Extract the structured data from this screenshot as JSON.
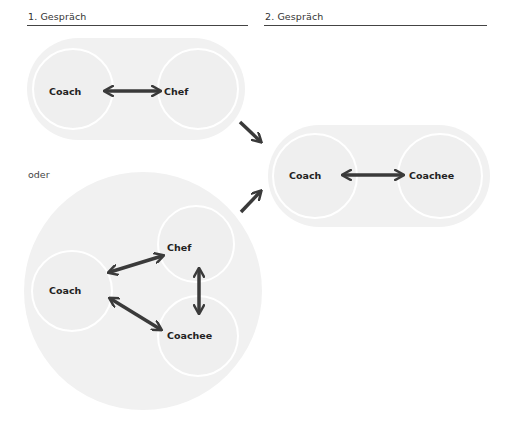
{
  "headers": {
    "first": "1. Gespräch",
    "second": "2. Gespräch"
  },
  "separator_label": "oder",
  "colors": {
    "group_fill": "#f1f1f1",
    "circle_outline": "#ffffff",
    "arrow": "#3a3a3a",
    "text": "#222222",
    "header_line": "#444444"
  },
  "diagram": {
    "first_conversation": {
      "nodes": [
        "Coach",
        "Chef"
      ],
      "relation": "Coach ↔ Chef"
    },
    "alternative_first_conversation": {
      "nodes": [
        "Chef",
        "Coach",
        "Coachee"
      ],
      "relations": [
        "Coach ↔ Chef",
        "Coach ↔ Coachee",
        "Chef ↔ Coachee"
      ]
    },
    "second_conversation": {
      "nodes": [
        "Coach",
        "Coachee"
      ],
      "relation": "Coach ↔ Coachee"
    },
    "flow_arrows": [
      "first → second",
      "alternative → second"
    ]
  },
  "nodes": {
    "p1_coach": "Coach",
    "p1_chef": "Chef",
    "p2_coach": "Coach",
    "p2_coachee": "Coachee",
    "t_chef": "Chef",
    "t_coach": "Coach",
    "t_coachee": "Coachee"
  }
}
